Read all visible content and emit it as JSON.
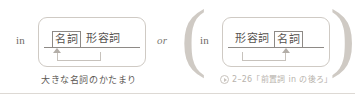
{
  "figure": {
    "separator_label": "or",
    "colors": {
      "text": "#57534f",
      "rule": "#8e8a86",
      "box_border": "#cfcac4",
      "muted": "#b8b3ad",
      "paren": "#cfcac4"
    }
  },
  "left_variant": {
    "preposition": "in",
    "slots": [
      {
        "label": "名詞",
        "boxed": true
      },
      {
        "label": "形容詞",
        "boxed": false
      }
    ],
    "caption": "大きな名詞のかたまり"
  },
  "right_variant": {
    "preposition": "in",
    "slots": [
      {
        "label": "形容詞",
        "boxed": false
      },
      {
        "label": "名詞",
        "boxed": true
      }
    ],
    "reference_icon": "circled-play-arrow-icon",
    "caption": "2–26「前置詞 in の後ろ」"
  }
}
